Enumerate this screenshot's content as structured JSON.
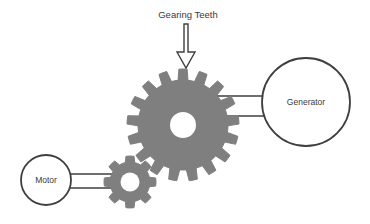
{
  "diagram": {
    "background_color": "#ffffff",
    "nodes": {
      "motor": {
        "label": "Motor",
        "shape": "circle",
        "cx": 46,
        "cy": 180,
        "r": 25,
        "stroke_color": "#3f3f3f",
        "fill_color": "#ffffff",
        "font_size": 8.5
      },
      "generator": {
        "label": "Generator",
        "shape": "circle",
        "cx": 306,
        "cy": 102,
        "r": 44,
        "stroke_color": "#3f3f3f",
        "fill_color": "#ffffff",
        "font_size": 8.5
      }
    },
    "gears": {
      "small_gear": {
        "name": "small-gear",
        "cx": 130,
        "cy": 182,
        "outer_radius": 26,
        "root_radius": 20,
        "hub_radius": 9.5,
        "teeth": 8,
        "fill_color": "#7f7f7f",
        "hub_color": "#ffffff"
      },
      "large_gear": {
        "name": "large-gear",
        "cx": 183,
        "cy": 125,
        "outer_radius": 56,
        "root_radius": 45,
        "hub_radius": 13,
        "teeth": 17,
        "fill_color": "#7f7f7f",
        "hub_color": "#ffffff"
      }
    },
    "shafts": {
      "motor_to_small_gear": {
        "name": "motor-shaft",
        "x1": 68,
        "x2": 114,
        "y_top": 174,
        "y_bottom": 188,
        "stroke_color": "#3f3f3f"
      },
      "large_gear_to_generator": {
        "name": "generator-shaft",
        "x1": 216,
        "x2": 268,
        "y_top": 96,
        "y_bottom": 116,
        "stroke_color": "#3f3f3f"
      }
    },
    "callout": {
      "label": "Gearing Teeth",
      "font_size": 9.5,
      "text_x": 188,
      "text_y": 18,
      "arrow": {
        "name": "down-arrow",
        "stem_x": 186,
        "stem_top": 24,
        "stem_bottom": 52,
        "head_top": 52,
        "head_tip_y": 68,
        "head_half_width": 9,
        "stem_half_width": 2,
        "stroke_color": "#3f3f3f",
        "fill_color": "#ffffff"
      }
    }
  }
}
